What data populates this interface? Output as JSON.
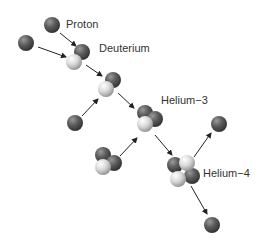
{
  "diagram": {
    "type": "proton-proton chain",
    "labels": {
      "proton": "Proton",
      "deuterium": "Deuterium",
      "helium3": "Helium−3",
      "helium4": "Helium−4"
    },
    "colors": {
      "proton": "#5a5a5a",
      "neutron": "#d6d6d6",
      "arrow": "#222222",
      "text": "#333333"
    },
    "legend": {
      "dark_sphere": "proton",
      "light_sphere": "neutron"
    },
    "steps": [
      {
        "from": [
          "Proton",
          "Proton"
        ],
        "to": "Deuterium"
      },
      {
        "from": [
          "Deuterium",
          "Proton"
        ],
        "to": "Helium−3"
      },
      {
        "from": [
          "Helium−3",
          "Helium−3"
        ],
        "to": "Helium−4",
        "products": [
          "Proton",
          "Proton"
        ]
      }
    ]
  }
}
